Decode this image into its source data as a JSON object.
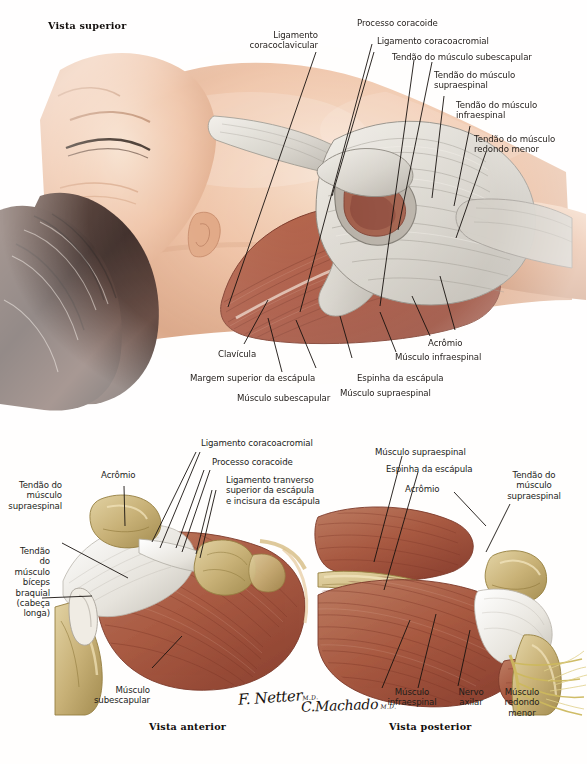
{
  "plate": {
    "title_top": "Vista superior",
    "caption_anterior": "Vista anterior",
    "caption_posterior": "Vista posterior"
  },
  "signatures": {
    "netter": "F. Netter",
    "netter_suffix": "M.D.",
    "machado": "C.Machado",
    "machado_suffix": "M.D."
  },
  "colors": {
    "muscle": "#ab5840",
    "muscle_dark": "#8d4231",
    "muscle_light": "#c47c63",
    "tendon": "#d9d6d0",
    "tendon_white": "#f2efe9",
    "bone": "#cdb87f",
    "bone_dark": "#a8914f",
    "nerve": "#d8c96f",
    "skin": "#e8b595",
    "skin_light": "#f6ddc9",
    "skin_dark": "#c98f6b",
    "hair": "#33201a",
    "line": "#17120f",
    "text": "#221d1a"
  },
  "top_view": {
    "labels": [
      {
        "id": "ligamento-coracoclavicular",
        "text": "Ligamento\ncoracoclavicular"
      },
      {
        "id": "processo-coracoide",
        "text": "Processo coracoide"
      },
      {
        "id": "ligamento-coracoacromial",
        "text": "Ligamento coracoacromial"
      },
      {
        "id": "tendao-subescapular",
        "text": "Tendão do músculo subescapular"
      },
      {
        "id": "tendao-supraespinal",
        "text": "Tendão do músculo\nsupraespinal"
      },
      {
        "id": "tendao-infraespinal",
        "text": "Tendão do músculo\ninfraespinal"
      },
      {
        "id": "tendao-redondo-menor",
        "text": "Tendão do músculo\nredondo menor"
      },
      {
        "id": "acromio",
        "text": "Acrômio"
      },
      {
        "id": "musculo-infraespinal",
        "text": "Músculo infraespinal"
      },
      {
        "id": "espinha-escapula",
        "text": "Espinha da escápula"
      },
      {
        "id": "musculo-supraespinal",
        "text": "Músculo supraespinal"
      },
      {
        "id": "musculo-subescapular",
        "text": "Músculo subescapular"
      },
      {
        "id": "margem-superior-escapula",
        "text": "Margem superior da escápula"
      },
      {
        "id": "clavicula",
        "text": "Clavícula"
      }
    ]
  },
  "anterior_view": {
    "labels": [
      {
        "id": "tendao-supraespinal-ant",
        "text": "Tendão do\nmúsculo\nsupraespinal"
      },
      {
        "id": "acromio-ant",
        "text": "Acrômio"
      },
      {
        "id": "ligamento-coracoacromial-ant",
        "text": "Ligamento coracoacromial"
      },
      {
        "id": "processo-coracoide-ant",
        "text": "Processo coracoide"
      },
      {
        "id": "ligamento-transverso",
        "text": "Ligamento tranverso\nsuperior da escápula\ne incisura da escápula"
      },
      {
        "id": "tendao-biceps-braquial",
        "text": "Tendão\ndo\nmúsculo\nbíceps\nbraquial\n(cabeça\nlonga)"
      },
      {
        "id": "musculo-subescapular-ant",
        "text": "Músculo\nsubescapular"
      }
    ]
  },
  "posterior_view": {
    "labels": [
      {
        "id": "musculo-supraespinal-post",
        "text": "Músculo supraespinal"
      },
      {
        "id": "espinha-escapula-post",
        "text": "Espinha da escápula"
      },
      {
        "id": "acromio-post",
        "text": "Acrômio"
      },
      {
        "id": "tendao-supraespinal-post",
        "text": "Tendão do\nmúsculo\nsupraespinal"
      },
      {
        "id": "musculo-infraespinal-post",
        "text": "Músculo\ninfraespinal"
      },
      {
        "id": "nervo-axilar",
        "text": "Nervo\naxilar"
      },
      {
        "id": "musculo-redondo-menor",
        "text": "Músculo\nredondo\nmenor"
      }
    ]
  }
}
